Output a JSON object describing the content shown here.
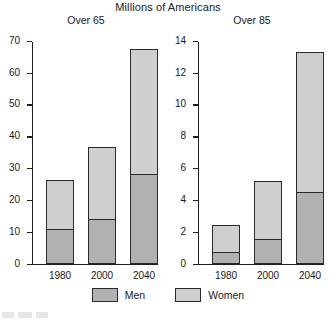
{
  "chart_data": {
    "type": "bar",
    "title": "Millions of Americans",
    "stacked": true,
    "legend_position": "bottom",
    "grid": false,
    "legend": [
      {
        "name": "Men",
        "color": "#b1b1b1"
      },
      {
        "name": "Women",
        "color": "#cfcfcf"
      }
    ],
    "panels": [
      {
        "id": "over-65",
        "title": "Over 65",
        "xlabel": "",
        "ylabel": "",
        "ylim": [
          0,
          70
        ],
        "yticks": [
          0,
          10,
          20,
          30,
          40,
          50,
          60,
          70
        ],
        "categories": [
          "1980",
          "2000",
          "2040"
        ],
        "series": [
          {
            "name": "Men",
            "values": [
              11.0,
              14.0,
              28.0
            ]
          },
          {
            "name": "Women",
            "values": [
              15.2,
              22.5,
              39.5
            ]
          }
        ],
        "totals": [
          26.2,
          36.5,
          67.5
        ]
      },
      {
        "id": "over-85",
        "title": "Over 85",
        "xlabel": "",
        "ylabel": "",
        "ylim": [
          0,
          14
        ],
        "yticks": [
          0,
          2,
          4,
          6,
          8,
          10,
          12,
          14
        ],
        "categories": [
          "1980",
          "2000",
          "2040"
        ],
        "series": [
          {
            "name": "Men",
            "values": [
              0.7,
              1.5,
              4.5
            ]
          },
          {
            "name": "Women",
            "values": [
              1.7,
              3.7,
              8.8
            ]
          }
        ],
        "totals": [
          2.4,
          5.2,
          13.3
        ]
      }
    ]
  }
}
